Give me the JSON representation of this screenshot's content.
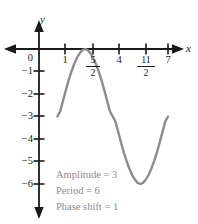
{
  "chart_data": {
    "type": "line",
    "title": "",
    "xlabel": "x",
    "ylabel": "y",
    "xlim": [
      -0.6,
      8.0
    ],
    "ylim": [
      -7.0,
      0.8
    ],
    "grid": false,
    "legend": null,
    "x_ticks": [
      {
        "value": 1,
        "label": "1",
        "type": "integer"
      },
      {
        "value": 2.5,
        "label": "5/2",
        "numerator": "5",
        "denominator": "2",
        "type": "fraction"
      },
      {
        "value": 4,
        "label": "4",
        "type": "integer"
      },
      {
        "value": 5.5,
        "label": "11/2",
        "numerator": "11",
        "denominator": "2",
        "type": "fraction"
      },
      {
        "value": 7,
        "label": "7",
        "type": "integer"
      }
    ],
    "y_ticks": [
      {
        "value": 0,
        "label": "0"
      },
      {
        "value": -1,
        "label": "−1"
      },
      {
        "value": -2,
        "label": "−2"
      },
      {
        "value": -3,
        "label": "−3"
      },
      {
        "value": -4,
        "label": "−4"
      },
      {
        "value": -5,
        "label": "−5"
      },
      {
        "value": -6,
        "label": "−6"
      }
    ],
    "series": [
      {
        "name": "y = -3 - 3cos(pi(x-1)/3)",
        "color": "#8c8c8c",
        "x": [
          1.0,
          1.15,
          1.3,
          1.45,
          1.6,
          1.75,
          1.9,
          2.05,
          2.2,
          2.35,
          2.5,
          2.65,
          2.8,
          2.95,
          3.1,
          3.25,
          3.4,
          3.55,
          3.7,
          3.85,
          4.0,
          4.15,
          4.3,
          4.45,
          4.6,
          4.75,
          4.9,
          5.05,
          5.2,
          5.35,
          5.5,
          5.65,
          5.8,
          5.95,
          6.1,
          6.25,
          6.4,
          6.55,
          6.7,
          6.85,
          7.0
        ],
        "y": [
          -3.0,
          -2.77,
          -2.31,
          -1.85,
          -1.41,
          -1.03,
          -0.69,
          -0.41,
          -0.2,
          -0.05,
          0.0,
          -0.05,
          -0.2,
          -0.41,
          -0.69,
          -1.03,
          -1.41,
          -1.85,
          -2.31,
          -2.77,
          -3.0,
          -3.23,
          -3.69,
          -4.15,
          -4.59,
          -4.97,
          -5.31,
          -5.59,
          -5.8,
          -5.95,
          -6.0,
          -5.95,
          -5.8,
          -5.59,
          -5.31,
          -4.97,
          -4.59,
          -4.15,
          -3.69,
          -3.23,
          -3.0
        ]
      }
    ],
    "key_points": {
      "start": {
        "x": 1,
        "y": -3
      },
      "maximum": {
        "x": 2.5,
        "y": 0
      },
      "minimum": {
        "x": 5.5,
        "y": -6
      },
      "end": {
        "x": 7,
        "y": -3
      }
    }
  },
  "annotations": {
    "amplitude": "Amplitude = 3",
    "period": "Period = 6",
    "phase_shift": "Phase shift = 1"
  },
  "colors": {
    "curve": "#8c8c8c",
    "axis": "#1a1a1a",
    "annotation_text": "#8c8c8c",
    "background": "#ffffff"
  }
}
